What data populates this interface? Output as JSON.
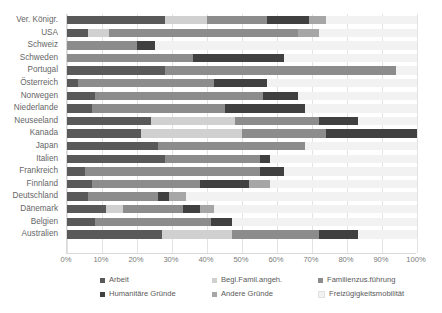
{
  "chart_data": {
    "type": "bar",
    "orientation": "horizontal",
    "stacked": true,
    "title": "",
    "xlabel": "",
    "ylabel": "",
    "xlim": [
      0,
      100
    ],
    "xticks": [
      "0%",
      "10%",
      "20%",
      "30%",
      "40%",
      "50%",
      "60%",
      "70%",
      "80%",
      "90%",
      "100%"
    ],
    "grid": true,
    "legend_position": "bottom",
    "categories": [
      "Ver. Königr.",
      "USA",
      "Schweiz",
      "Schweden",
      "Portugal",
      "Österreich",
      "Norwegen",
      "Niederlande",
      "Neuseeland",
      "Kanada",
      "Japan",
      "Italien",
      "Frankreich",
      "Finnland",
      "Deutschland",
      "Dänemark",
      "Belgien",
      "Australien"
    ],
    "series": [
      {
        "name": "Arbeit",
        "color": "#595959",
        "values": [
          28,
          6,
          0,
          0,
          28,
          3,
          8,
          7,
          24,
          21,
          26,
          28,
          5,
          7,
          6,
          11,
          8,
          27
        ]
      },
      {
        "name": "Begl.Famil.angeh.",
        "color": "#d0d0d0",
        "values": [
          12,
          6,
          0,
          0,
          0,
          0,
          0,
          0,
          24,
          29,
          0,
          0,
          0,
          0,
          0,
          5,
          0,
          20
        ]
      },
      {
        "name": "Familienzus.führung",
        "color": "#8c8c8c",
        "values": [
          17,
          54,
          20,
          36,
          66,
          39,
          48,
          38,
          24,
          24,
          42,
          27,
          50,
          31,
          20,
          17,
          33,
          25
        ]
      },
      {
        "name": "Humanitäre Gründe",
        "color": "#404040",
        "values": [
          12,
          0,
          5,
          26,
          0,
          15,
          10,
          23,
          11,
          26,
          0,
          3,
          7,
          14,
          3,
          5,
          6,
          11
        ]
      },
      {
        "name": "Andere Gründe",
        "color": "#a6a6a6",
        "values": [
          5,
          6,
          0,
          0,
          0,
          0,
          0,
          0,
          0,
          0,
          0,
          0,
          0,
          6,
          5,
          4,
          0,
          0
        ]
      },
      {
        "name": "Freizügigkeitsmobilität",
        "color": "#f2f2f2",
        "values": [
          26,
          28,
          75,
          38,
          6,
          43,
          34,
          32,
          17,
          0,
          32,
          42,
          38,
          42,
          66,
          58,
          53,
          17
        ]
      }
    ]
  },
  "legend": {
    "items": [
      {
        "label": "Arbeit",
        "color": "#595959"
      },
      {
        "label": "Begl.Famil.angeh.",
        "color": "#d0d0d0"
      },
      {
        "label": "Familienzus.führung",
        "color": "#8c8c8c"
      },
      {
        "label": "Humanitäre Gründe",
        "color": "#404040"
      },
      {
        "label": "Andere Gründe",
        "color": "#a6a6a6"
      },
      {
        "label": "Freizügigkeitsmobilität",
        "color": "#f2f2f2"
      }
    ]
  }
}
